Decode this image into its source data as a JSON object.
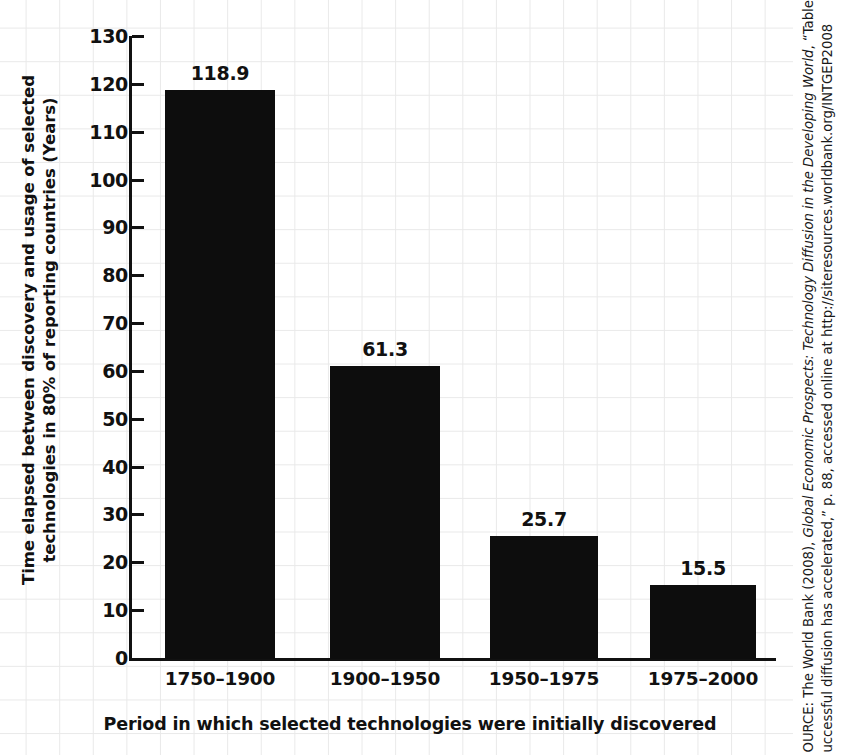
{
  "chart_data": {
    "type": "bar",
    "title": "",
    "categories": [
      "1750–1900",
      "1900–1950",
      "1950–1975",
      "1975–2000"
    ],
    "values": [
      118.9,
      61.3,
      25.7,
      15.5
    ],
    "value_labels": [
      "118.9",
      "61.3",
      "25.7",
      "15.5"
    ],
    "xlabel": "Period in which selected technologies were initially discovered",
    "ylabel": "Time elapsed between discovery and usage of selected technologies in 80% of reporting countries (Years)",
    "ylabel_lines": [
      "Time elapsed between discovery and usage of selected",
      "technologies in 80% of reporting countries (Years)"
    ],
    "ylim": [
      0,
      130
    ],
    "ytick_labels": [
      "0",
      "10",
      "20",
      "30",
      "40",
      "50",
      "60",
      "70",
      "80",
      "90",
      "100",
      "110",
      "120",
      "130"
    ],
    "ytick_values": [
      0,
      10,
      20,
      30,
      40,
      50,
      60,
      70,
      80,
      90,
      100,
      110,
      120,
      130
    ],
    "ytick_step": 10,
    "grid": false,
    "legend": "none",
    "bar_color": "#0d0d0d",
    "axis_color": "#111111",
    "background_grid_color": "#e9e9e9"
  },
  "source": {
    "line1": "OURCE: The World Bank (2008), Global Economic Prospects: Technology Diffusion in the Developing World, “Table 2.14,",
    "line1_plain_a": "OURCE: The World Bank (2008), ",
    "line1_italic": "Global Economic Prospects: Technology Diffusion in the Developing World",
    "line1_plain_b": ", “Table 2.14,",
    "line2": "uccessful diffusion has accelerated,” p. 88, accessed online at http://siteresources.worldbank.org/INTGEP2008"
  }
}
